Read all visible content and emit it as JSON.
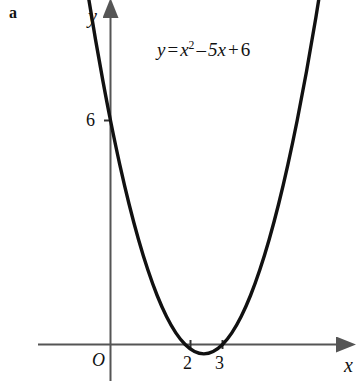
{
  "figure": {
    "panel_letter": "a",
    "background_color": "#ffffff",
    "axis_color": "#555555",
    "curve_color": "#111111",
    "text_color": "#111111"
  },
  "equation": {
    "full_text": "y = x^2 - 5x + 6",
    "lhs": "y",
    "equals": "=",
    "term1_base": "x",
    "term1_exponent": "2",
    "minus": "–",
    "term2": "5x",
    "plus": "+",
    "term3": "6"
  },
  "axes": {
    "x_label": "x",
    "y_label": "y",
    "origin_label": "O",
    "x_ticks": [
      {
        "label": "2",
        "value": 2
      },
      {
        "label": "3",
        "value": 3
      }
    ],
    "y_ticks": [
      {
        "label": "6",
        "value": 6
      }
    ]
  },
  "chart_data": {
    "type": "line",
    "title": "",
    "subtitle": "",
    "xlabel": "x",
    "ylabel": "y",
    "grid": false,
    "legend": null,
    "annotations": [
      {
        "text": "y = x² – 5x + 6",
        "x": 3.1,
        "y": 9.6
      },
      {
        "text": "a",
        "x": null,
        "y": null
      }
    ],
    "xlim": [
      -2.2,
      7.7
    ],
    "ylim": [
      -1.2,
      11.0
    ],
    "x_tick_labels": [
      "2",
      "3"
    ],
    "x_tick_values": [
      2,
      3
    ],
    "y_tick_labels": [
      "6"
    ],
    "y_tick_values": [
      6
    ],
    "origin_label": "O",
    "series": [
      {
        "name": "y = x^2 - 5x + 6",
        "function": "x^2 - 5x + 6",
        "roots": [
          2,
          3
        ],
        "vertex": [
          2.5,
          -0.25
        ],
        "y_intercept": 6,
        "x": [
          -1.4,
          -1.2,
          -1.0,
          -0.8,
          -0.6,
          -0.4,
          -0.2,
          0.0,
          0.25,
          0.5,
          0.75,
          1.0,
          1.25,
          1.5,
          1.75,
          2.0,
          2.25,
          2.5,
          2.75,
          3.0,
          3.25,
          3.5,
          3.75,
          4.0,
          4.25,
          4.5,
          4.75,
          5.0,
          5.25,
          5.5,
          5.75,
          6.0,
          6.2
        ],
        "y": [
          14.96,
          13.44,
          12.0,
          10.64,
          9.36,
          8.16,
          7.04,
          6.0,
          4.8125,
          3.75,
          2.8125,
          2.0,
          1.3125,
          0.75,
          0.3125,
          0.0,
          -0.1875,
          -0.25,
          -0.1875,
          0.0,
          0.3125,
          0.75,
          1.3125,
          2.0,
          2.8125,
          3.75,
          4.8125,
          6.0,
          7.3125,
          8.75,
          10.3125,
          12.0,
          13.04
        ]
      }
    ]
  }
}
